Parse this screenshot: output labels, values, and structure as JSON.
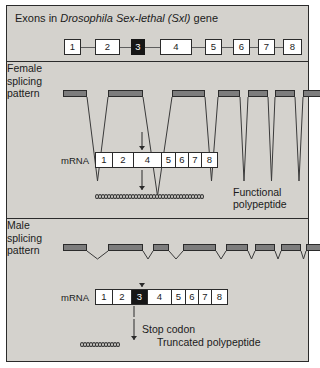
{
  "figure": {
    "title_parts": {
      "prefix": "Exons in ",
      "species": "Drosophila",
      "gene_long": " Sex-lethal (Sxl)",
      "suffix": " gene"
    },
    "title_plain": "Exons in Drosophila Sex-lethal (Sxl) gene"
  },
  "gene_map": {
    "exons": [
      {
        "label": "1",
        "x": 57,
        "width": 17,
        "dark": false
      },
      {
        "label": "2",
        "x": 88,
        "width": 25,
        "dark": false
      },
      {
        "label": "3",
        "x": 124,
        "width": 14,
        "dark": true
      },
      {
        "label": "4",
        "x": 153,
        "width": 32,
        "dark": false
      },
      {
        "label": "5",
        "x": 198,
        "width": 17,
        "dark": false
      },
      {
        "label": "6",
        "x": 226,
        "width": 17,
        "dark": false
      },
      {
        "label": "7",
        "x": 251,
        "width": 17,
        "dark": false
      },
      {
        "label": "8",
        "x": 276,
        "width": 19,
        "dark": false
      }
    ],
    "intron_connectors": [
      {
        "x": 74,
        "width": 14
      },
      {
        "x": 113,
        "width": 11
      },
      {
        "x": 138,
        "width": 15
      },
      {
        "x": 185,
        "width": 13
      },
      {
        "x": 215,
        "width": 11
      },
      {
        "x": 243,
        "width": 8
      },
      {
        "x": 268,
        "width": 8
      }
    ]
  },
  "female": {
    "label_lines": [
      "Female",
      "splicing",
      "pattern"
    ],
    "pattern": {
      "bars": [
        {
          "x": 56,
          "width": 24
        },
        {
          "x": 101,
          "width": 35
        },
        {
          "x": 165,
          "width": 33
        },
        {
          "x": 211,
          "width": 22
        },
        {
          "x": 241,
          "width": 20
        },
        {
          "x": 268,
          "width": 20
        },
        {
          "x": 296,
          "width": 26
        }
      ],
      "loops": [
        {
          "x1": 80,
          "x2": 101,
          "apex": 119
        },
        {
          "x1": 136,
          "x2": 165,
          "apex": 134
        },
        {
          "x1": 198,
          "x2": 211,
          "apex": 119
        },
        {
          "x1": 233,
          "x2": 241,
          "apex": 119
        },
        {
          "x1": 261,
          "x2": 268,
          "apex": 119
        },
        {
          "x1": 288,
          "x2": 296,
          "apex": 119
        }
      ]
    },
    "mrna_label": "mRNA",
    "mrna_cells": [
      {
        "label": "1",
        "width": 17,
        "dark": false
      },
      {
        "label": "2",
        "width": 21,
        "dark": false
      },
      {
        "label": "4",
        "width": 28,
        "dark": false
      },
      {
        "label": "5",
        "width": 14,
        "dark": false
      },
      {
        "label": "6",
        "width": 13,
        "dark": false
      },
      {
        "label": "7",
        "width": 13,
        "dark": false
      },
      {
        "label": "8",
        "width": 15,
        "dark": false
      }
    ],
    "product_label_lines": [
      "Functional",
      "polypeptide"
    ],
    "peptide_beads": 36
  },
  "male": {
    "label_lines": [
      "Male",
      "splicing",
      "pattern"
    ],
    "pattern": {
      "bars": [
        {
          "x": 56,
          "width": 24
        },
        {
          "x": 101,
          "width": 35
        },
        {
          "x": 146,
          "width": 16
        },
        {
          "x": 176,
          "width": 33
        },
        {
          "x": 219,
          "width": 22
        },
        {
          "x": 248,
          "width": 20
        },
        {
          "x": 274,
          "width": 20
        },
        {
          "x": 299,
          "width": 26
        }
      ],
      "loops": [
        {
          "x1": 80,
          "x2": 101,
          "apex": 40
        },
        {
          "x1": 136,
          "x2": 146,
          "apex": 40
        },
        {
          "x1": 162,
          "x2": 176,
          "apex": 40
        },
        {
          "x1": 209,
          "x2": 219,
          "apex": 40
        },
        {
          "x1": 241,
          "x2": 248,
          "apex": 40
        },
        {
          "x1": 268,
          "x2": 274,
          "apex": 40
        },
        {
          "x1": 294,
          "x2": 299,
          "apex": 40
        }
      ]
    },
    "mrna_label": "mRNA",
    "mrna_cells": [
      {
        "label": "1",
        "width": 17,
        "dark": false
      },
      {
        "label": "2",
        "width": 19,
        "dark": false
      },
      {
        "label": "3",
        "width": 16,
        "dark": true
      },
      {
        "label": "4",
        "width": 24,
        "dark": false
      },
      {
        "label": "5",
        "width": 14,
        "dark": false
      },
      {
        "label": "6",
        "width": 13,
        "dark": false
      },
      {
        "label": "7",
        "width": 13,
        "dark": false
      },
      {
        "label": "8",
        "width": 15,
        "dark": false
      }
    ],
    "stop_codon_label": "Stop codon",
    "product_label": "Truncated polypeptide",
    "peptide_beads": 13
  }
}
